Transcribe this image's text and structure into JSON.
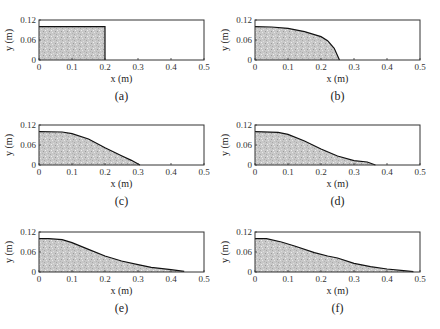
{
  "figure": {
    "panels": [
      {
        "id": "a",
        "caption": "(a)",
        "col": 0,
        "row": 0
      },
      {
        "id": "b",
        "caption": "(b)",
        "col": 1,
        "row": 0
      },
      {
        "id": "c",
        "caption": "(c)",
        "col": 0,
        "row": 1
      },
      {
        "id": "d",
        "caption": "(d)",
        "col": 1,
        "row": 1
      },
      {
        "id": "e",
        "caption": "(e)",
        "col": 0,
        "row": 2
      },
      {
        "id": "f",
        "caption": "(f)",
        "col": 1,
        "row": 2
      }
    ],
    "xlabel": "x (m)",
    "ylabel": "y (m)",
    "xticks": [
      "0",
      "0.1",
      "0.2",
      "0.3",
      "0.4",
      "0.5"
    ],
    "yticks": [
      "0",
      "0.06",
      "0.12"
    ],
    "colors": {
      "fill": "#c8c8c8",
      "line": "#111111",
      "frame": "#333333"
    }
  },
  "chart_data": [
    {
      "type": "area",
      "title": "(a)",
      "xlabel": "x (m)",
      "ylabel": "y (m)",
      "xlim": [
        0,
        0.5
      ],
      "ylim": [
        0,
        0.12
      ],
      "x": [
        0,
        0.2,
        0.2
      ],
      "y": [
        0.1,
        0.1,
        0
      ]
    },
    {
      "type": "area",
      "title": "(b)",
      "xlabel": "x (m)",
      "ylabel": "y (m)",
      "xlim": [
        0,
        0.5
      ],
      "ylim": [
        0,
        0.12
      ],
      "x": [
        0,
        0.05,
        0.1,
        0.15,
        0.2,
        0.22,
        0.24,
        0.256
      ],
      "y": [
        0.1,
        0.099,
        0.095,
        0.085,
        0.07,
        0.058,
        0.035,
        0
      ]
    },
    {
      "type": "area",
      "title": "(c)",
      "xlabel": "x (m)",
      "ylabel": "y (m)",
      "xlim": [
        0,
        0.5
      ],
      "ylim": [
        0,
        0.12
      ],
      "x": [
        0,
        0.07,
        0.1,
        0.15,
        0.2,
        0.25,
        0.28,
        0.306
      ],
      "y": [
        0.1,
        0.099,
        0.094,
        0.078,
        0.052,
        0.028,
        0.014,
        0
      ]
    },
    {
      "type": "area",
      "title": "(d)",
      "xlabel": "x (m)",
      "ylabel": "y (m)",
      "xlim": [
        0,
        0.5
      ],
      "ylim": [
        0,
        0.12
      ],
      "x": [
        0,
        0.07,
        0.1,
        0.15,
        0.2,
        0.25,
        0.3,
        0.34,
        0.365
      ],
      "y": [
        0.1,
        0.098,
        0.092,
        0.072,
        0.048,
        0.027,
        0.013,
        0.009,
        0
      ]
    },
    {
      "type": "area",
      "title": "(e)",
      "xlabel": "x (m)",
      "ylabel": "y (m)",
      "xlim": [
        0,
        0.5
      ],
      "ylim": [
        0,
        0.12
      ],
      "x": [
        0,
        0.03,
        0.07,
        0.1,
        0.15,
        0.2,
        0.25,
        0.3,
        0.34,
        0.4,
        0.44
      ],
      "y": [
        0.1,
        0.1,
        0.097,
        0.088,
        0.068,
        0.048,
        0.033,
        0.022,
        0.014,
        0.007,
        0.002
      ]
    },
    {
      "type": "area",
      "title": "(f)",
      "xlabel": "x (m)",
      "ylabel": "y (m)",
      "xlim": [
        0,
        0.5
      ],
      "ylim": [
        0,
        0.12
      ],
      "x": [
        0,
        0.035,
        0.08,
        0.12,
        0.18,
        0.22,
        0.25,
        0.3,
        0.35,
        0.4,
        0.45,
        0.48
      ],
      "y": [
        0.1,
        0.1,
        0.09,
        0.078,
        0.058,
        0.048,
        0.042,
        0.026,
        0.016,
        0.009,
        0.004,
        0.001
      ]
    }
  ]
}
